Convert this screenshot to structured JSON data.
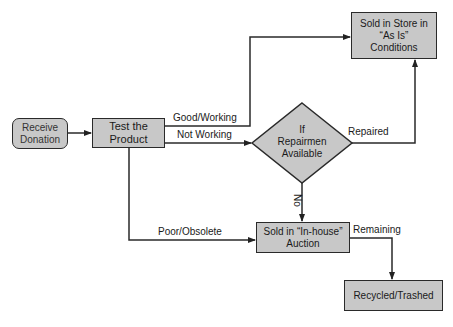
{
  "nodes": {
    "receive": {
      "label": "Receive Donation",
      "line1": "Receive",
      "line2": "Donation"
    },
    "test": {
      "label": "Test the Product",
      "line1": "Test the",
      "line2": "Product"
    },
    "store": {
      "label": "Sold in Store in \"As Is\" Conditions",
      "line1": "Sold in Store in",
      "line2": "“As Is”",
      "line3": "Conditions"
    },
    "decision": {
      "label": "If Repairmen Available",
      "line1": "If",
      "line2": "Repairmen",
      "line3": "Available"
    },
    "auction": {
      "label": "Sold in \"In-house\" Auction",
      "line1": "Sold in “In-house”",
      "line2": "Auction"
    },
    "recycled": {
      "label": "Recycled/Trashed"
    }
  },
  "edges": {
    "good": "Good/Working",
    "notworking": "Not Working",
    "repaired": "Repaired",
    "no": "No",
    "poor": "Poor/Obsolete",
    "remaining": "Remaining"
  },
  "colors": {
    "box_fill": "#c8c8c8",
    "stroke": "#2a2a2a"
  }
}
